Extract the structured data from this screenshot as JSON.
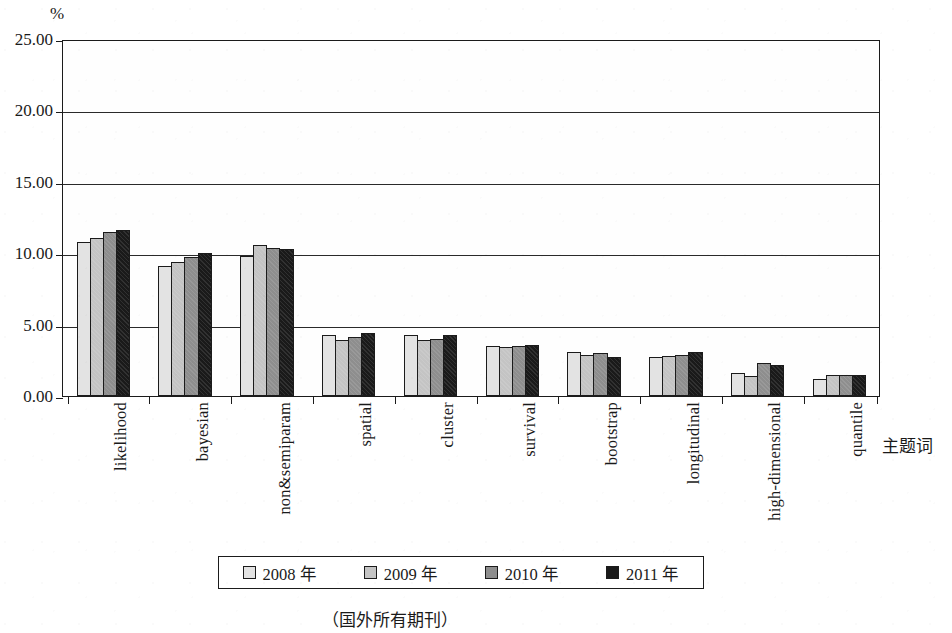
{
  "axis": {
    "y_unit": "%",
    "x_title": "主题词",
    "y_ticks": [
      "25.00",
      "20.00",
      "15.00",
      "10.00",
      "5.00",
      "0.00"
    ]
  },
  "caption": "（国外所有期刊）",
  "legend": {
    "items": [
      {
        "label": "2008 年",
        "color": "#e3e3e3"
      },
      {
        "label": "2009 年",
        "color": "#c4c4c4"
      },
      {
        "label": "2010 年",
        "color": "#8e8e8e"
      },
      {
        "label": "2011 年",
        "color": "#1a1a1a"
      }
    ]
  },
  "chart_data": {
    "type": "bar",
    "title": "",
    "subtitle": "",
    "xlabel": "主题词",
    "ylabel": "%",
    "ylim": [
      0,
      25
    ],
    "ytick_step": 5,
    "grid": true,
    "legend_position": "bottom",
    "categories": [
      "likelihood",
      "bayesian",
      "non&semiparam",
      "spatial",
      "cluster",
      "survival",
      "bootstrap",
      "longitudinal",
      "high-dimensional",
      "quantile"
    ],
    "series": [
      {
        "name": "2008 年",
        "color": "#e3e3e3",
        "values": [
          10.8,
          9.1,
          9.8,
          4.3,
          4.3,
          3.5,
          3.1,
          2.7,
          1.6,
          1.2
        ]
      },
      {
        "name": "2009 年",
        "color": "#c4c4c4",
        "values": [
          11.1,
          9.4,
          10.6,
          3.9,
          3.9,
          3.4,
          2.9,
          2.8,
          1.4,
          1.5
        ]
      },
      {
        "name": "2010 年",
        "color": "#8e8e8e",
        "values": [
          11.5,
          9.7,
          10.4,
          4.1,
          4.0,
          3.5,
          3.0,
          2.9,
          2.3,
          1.5
        ]
      },
      {
        "name": "2011 年",
        "color": "#1a1a1a",
        "values": [
          11.6,
          10.0,
          10.3,
          4.4,
          4.3,
          3.6,
          2.7,
          3.1,
          2.2,
          1.5
        ]
      }
    ]
  }
}
